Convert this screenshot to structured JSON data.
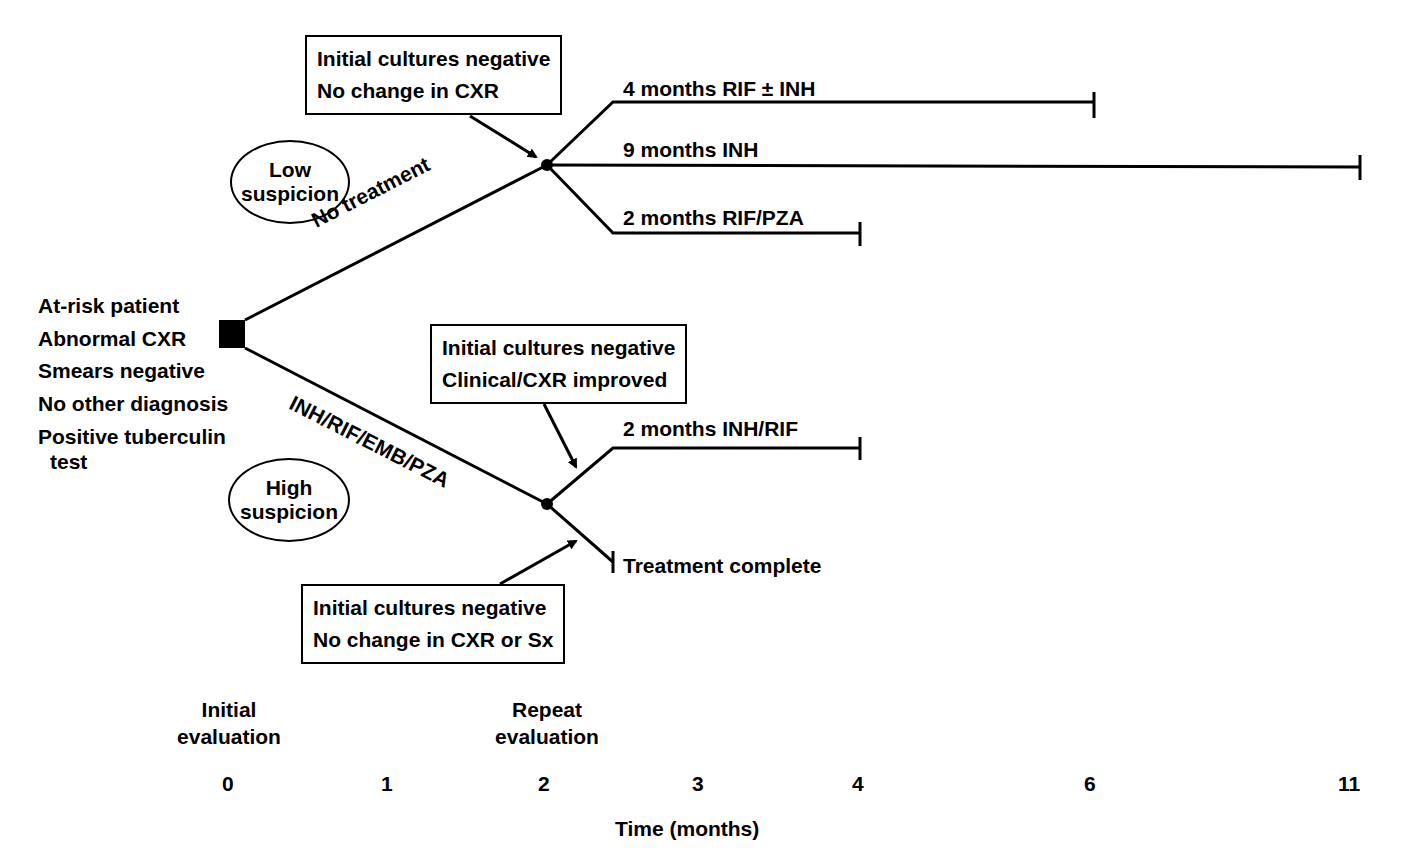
{
  "patient": {
    "lines": [
      "At-risk patient",
      "Abnormal CXR",
      "Smears negative",
      "No other diagnosis",
      "Positive tuberculin",
      "test"
    ]
  },
  "suspicion": {
    "low": [
      "Low",
      "suspicion"
    ],
    "high": [
      "High",
      "suspicion"
    ]
  },
  "branches": {
    "low_label": "No treatment",
    "high_label": "INH/RIF/EMB/PZA"
  },
  "boxes": {
    "top": [
      "Initial cultures negative",
      "No change in CXR"
    ],
    "middle": [
      "Initial cultures negative",
      "Clinical/CXR improved"
    ],
    "bottom": [
      "Initial cultures negative",
      "No change in CXR or Sx"
    ]
  },
  "outcomes": {
    "rif_inh": "4 months RIF ± INH",
    "inh9": "9 months INH",
    "rif_pza": "2 months RIF/PZA",
    "inh_rif": "2 months INH/RIF",
    "complete": "Treatment complete"
  },
  "timeline": {
    "initial": [
      "Initial",
      "evaluation"
    ],
    "repeat": [
      "Repeat",
      "evaluation"
    ],
    "ticks": [
      "0",
      "1",
      "2",
      "3",
      "4",
      "6",
      "11"
    ],
    "axis_label": "Time (months)"
  }
}
